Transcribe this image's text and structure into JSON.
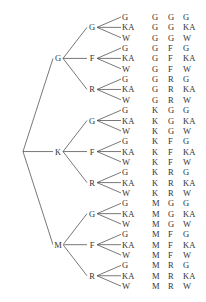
{
  "tree": {
    "root": "",
    "level1": [
      "G",
      "K",
      "M"
    ],
    "level2": [
      "G",
      "F",
      "R"
    ],
    "level3": [
      "G",
      "KA",
      "W"
    ]
  },
  "outcomes": [
    [
      "G",
      "G",
      "G"
    ],
    [
      "G",
      "G",
      "KA"
    ],
    [
      "G",
      "G",
      "W"
    ],
    [
      "G",
      "F",
      "G"
    ],
    [
      "G",
      "F",
      "KA"
    ],
    [
      "G",
      "F",
      "W"
    ],
    [
      "G",
      "R",
      "G"
    ],
    [
      "G",
      "R",
      "KA"
    ],
    [
      "G",
      "R",
      "W"
    ],
    [
      "K",
      "G",
      "G"
    ],
    [
      "K",
      "G",
      "KA"
    ],
    [
      "K",
      "G",
      "W"
    ],
    [
      "K",
      "F",
      "G"
    ],
    [
      "K",
      "F",
      "KA"
    ],
    [
      "K",
      "F",
      "W"
    ],
    [
      "K",
      "R",
      "G"
    ],
    [
      "K",
      "R",
      "KA"
    ],
    [
      "K",
      "R",
      "W"
    ],
    [
      "M",
      "G",
      "G"
    ],
    [
      "M",
      "G",
      "KA"
    ],
    [
      "M",
      "G",
      "W"
    ],
    [
      "M",
      "F",
      "G"
    ],
    [
      "M",
      "F",
      "KA"
    ],
    [
      "M",
      "F",
      "W"
    ],
    [
      "M",
      "R",
      "G"
    ],
    [
      "M",
      "R",
      "KA"
    ],
    [
      "M",
      "R",
      "W"
    ]
  ],
  "colors": {
    "line": "#555555",
    "text": "#333333"
  }
}
